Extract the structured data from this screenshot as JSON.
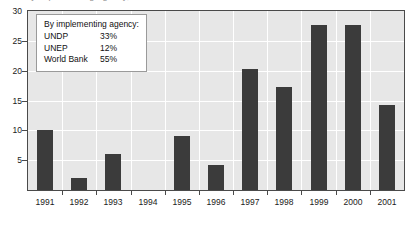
{
  "title_sliver": "by implementing agency, 1991-2001",
  "legend": {
    "title": "By implementing agency:",
    "rows": [
      {
        "name": "UNDP",
        "value": "33%"
      },
      {
        "name": "UNEP",
        "value": "12%"
      },
      {
        "name": "World Bank",
        "value": "55%"
      }
    ]
  },
  "chart_data": {
    "type": "bar",
    "title": "",
    "xlabel": "",
    "ylabel": "",
    "categories": [
      "1991",
      "1992",
      "1993",
      "1994",
      "1995",
      "1996",
      "1997",
      "1998",
      "1999",
      "2000",
      "2001"
    ],
    "values": [
      10.1,
      2.0,
      6.0,
      0,
      9.0,
      4.2,
      20.2,
      17.3,
      27.7,
      27.7,
      14.3
    ],
    "ylim": [
      0,
      30
    ],
    "yticks": [
      0,
      5,
      10,
      15,
      20,
      25,
      30
    ],
    "ytick_labels": [
      "",
      "5",
      "10",
      "15",
      "20",
      "25",
      "30"
    ],
    "grid": true,
    "legend_position": "upper-left",
    "bar_color": "#3b3b3b",
    "plot_background": "#e7e7e7",
    "gridline_color": "#ffffff",
    "axis_color": "#4a4a4a"
  }
}
